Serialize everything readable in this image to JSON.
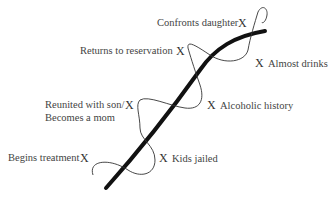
{
  "diagram": {
    "type": "narrative-arc",
    "colors": {
      "background": "#ffffff",
      "main_line": "#111111",
      "wave_line": "#333333",
      "text": "#444444"
    },
    "events": [
      {
        "id": "confronts-daughter",
        "label": "Confronts daughter",
        "marker": "X",
        "side": "left"
      },
      {
        "id": "returns-to-reservation",
        "label": "Returns to reservation",
        "marker": "X",
        "side": "left"
      },
      {
        "id": "almost-drinks",
        "label": "Almost drinks",
        "marker": "X",
        "side": "right"
      },
      {
        "id": "reunited-with-son",
        "label": "Reunited with son/",
        "label2": "Becomes a mom",
        "marker": "X",
        "side": "left"
      },
      {
        "id": "alcoholic-history",
        "label": "Alcoholic history",
        "marker": "X",
        "side": "right"
      },
      {
        "id": "begins-treatment",
        "label": "Begins treatment",
        "marker": "X",
        "side": "left"
      },
      {
        "id": "kids-jailed",
        "label": "Kids jailed",
        "marker": "X",
        "side": "right"
      }
    ]
  }
}
